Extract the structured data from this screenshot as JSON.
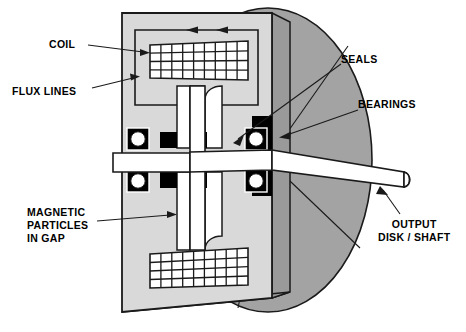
{
  "figure": {
    "type": "cutaway-cross-section"
  },
  "labels": {
    "coil": "COIL",
    "flux_lines": "FLUX LINES",
    "seals": "SEALS",
    "bearings": "BEARINGS",
    "magnetic_particles": "MAGNETIC\nPARTICLES\nIN GAP",
    "output": "OUTPUT\nDISK / SHAFT"
  },
  "colors": {
    "housing_face": "#d9d9d9",
    "housing_side": "#9a9a9a",
    "disk": "#a3a3a3",
    "outline": "#1a1a1a",
    "black_part": "#000000",
    "white_part": "#ffffff",
    "background": "#ffffff"
  },
  "components": {
    "housing": "stator-housing",
    "coil_top": "upper-coil-winding",
    "coil_bottom": "lower-coil-winding",
    "coil_grid_columns": 9,
    "coil_grid_rows": 4,
    "flux_loop": "magnetic-flux-path",
    "bearings_count": 4,
    "seals_count": 4,
    "output_disk": "output-disk",
    "output_shaft": "output-shaft"
  }
}
